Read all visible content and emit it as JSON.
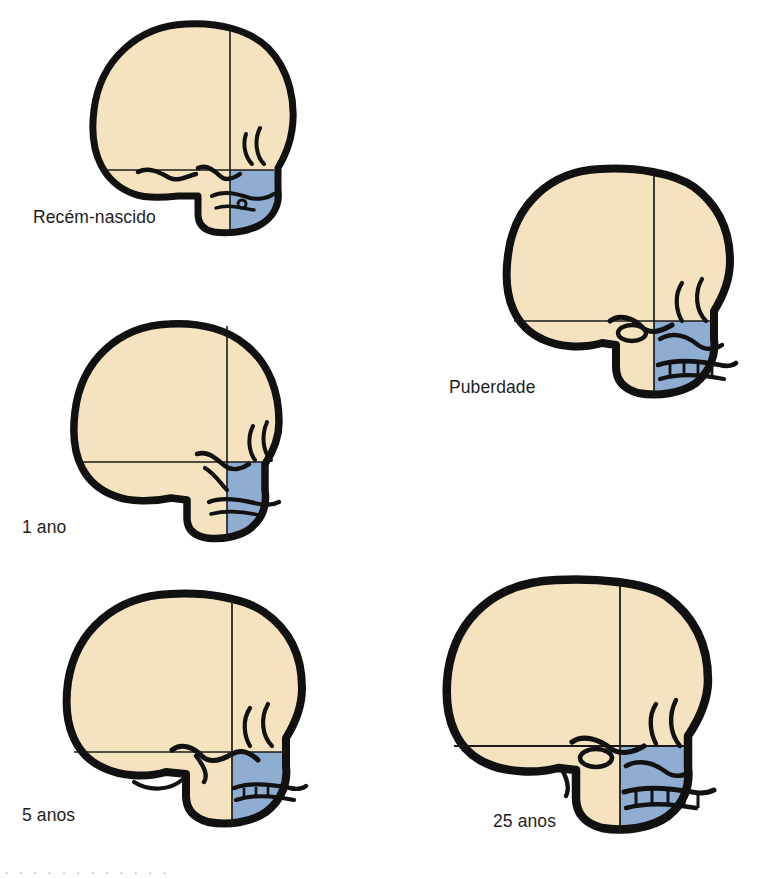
{
  "figure": {
    "background_color": "#ffffff",
    "palette": {
      "cranium_bone": "#F5E3C0",
      "cranium_bone_shadow": "#E8D3AC",
      "viscerocranium_blue": "#8FADD1",
      "viscerocranium_blue_dark": "#7C9CC4",
      "outline_black": "#111111",
      "reference_line": "#1a1a1a",
      "label_text": "#1d1d1d"
    },
    "bottom_cut_text": "· ·  · ·   · ·    · ·   · ·  · ·"
  },
  "stages": [
    {
      "id": "newborn",
      "label": "Recém-nascido",
      "order": 1,
      "relative_size": "smallest",
      "neurocranium_share": "large",
      "viscerocranium_share": "small"
    },
    {
      "id": "oneyear",
      "label": "1 ano",
      "order": 2,
      "relative_size": "small",
      "neurocranium_share": "large",
      "viscerocranium_share": "small"
    },
    {
      "id": "fiveyear",
      "label": "5 anos",
      "order": 3,
      "relative_size": "medium",
      "neurocranium_share": "moderate",
      "viscerocranium_share": "moderate"
    },
    {
      "id": "puberty",
      "label": "Puberdade",
      "order": 4,
      "relative_size": "large",
      "neurocranium_share": "moderate",
      "viscerocranium_share": "large"
    },
    {
      "id": "adult",
      "label": "25 anos",
      "order": 5,
      "relative_size": "largest",
      "neurocranium_share": "moderate",
      "viscerocranium_share": "largest"
    }
  ]
}
